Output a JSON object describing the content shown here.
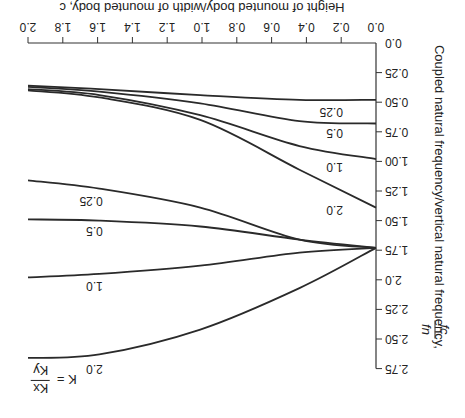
{
  "chart_data": {
    "type": "line",
    "orientation_note": "figure displayed rotated 180 degrees",
    "title": "",
    "xlabel": "Height of mounted body/width of mounted body, c",
    "ylabel": "Coupled natural frequency/vertical natural frequency, fc/fn",
    "legend_title": "K = Kx/Ky",
    "xlim": [
      0,
      2.0
    ],
    "ylim": [
      0,
      2.75
    ],
    "x_ticks": [
      "0.0",
      "0.2",
      "0.4",
      "0.6",
      "0.8",
      "1.0",
      "1.2",
      "1.4",
      "1.6",
      "1.8",
      "2.0"
    ],
    "y_ticks": [
      "0.0",
      "0.25",
      "0.50",
      "0.75",
      "1.00",
      "1.25",
      "1.50",
      "1.75",
      "2.0",
      "2.25",
      "2.50",
      "2.75"
    ],
    "grid": false,
    "x": [
      0,
      0.44,
      1.01,
      1.59,
      2.0
    ],
    "series": [
      {
        "name": "0.25 (lower mode)",
        "values": [
          0.48,
          0.48,
          0.44,
          0.39,
          0.36
        ]
      },
      {
        "name": "0.5 (lower mode)",
        "values": [
          0.68,
          0.66,
          0.51,
          0.41,
          0.37
        ]
      },
      {
        "name": "1.0 (lower mode)",
        "values": [
          0.98,
          0.87,
          0.61,
          0.44,
          0.39
        ]
      },
      {
        "name": "2.0 (lower mode)",
        "values": [
          1.39,
          1.07,
          0.65,
          0.46,
          0.4
        ]
      },
      {
        "name": "0.25 (upper mode)",
        "values": [
          1.73,
          1.66,
          1.39,
          1.23,
          1.16
        ]
      },
      {
        "name": "0.5 (upper mode)",
        "values": [
          1.73,
          1.66,
          1.55,
          1.5,
          1.49
        ]
      },
      {
        "name": "1.0 (upper mode)",
        "values": [
          1.73,
          1.77,
          1.88,
          1.95,
          1.98
        ]
      },
      {
        "name": "2.0 (upper mode)",
        "values": [
          1.73,
          2.07,
          2.42,
          2.63,
          2.66
        ]
      }
    ],
    "curve_labels": [
      {
        "text": "0.25",
        "x": 0.19,
        "y": 0.55
      },
      {
        "text": "0.5",
        "x": 0.19,
        "y": 0.73
      },
      {
        "text": "1.0",
        "x": 0.19,
        "y": 1.01
      },
      {
        "text": "2.0",
        "x": 0.19,
        "y": 1.38
      },
      {
        "text": "0.25",
        "x": 1.57,
        "y": 1.3
      },
      {
        "text": "0.5",
        "x": 1.57,
        "y": 1.55
      },
      {
        "text": "1.0",
        "x": 1.57,
        "y": 2.02
      },
      {
        "text": "2.0",
        "x": 1.57,
        "y": 2.72
      }
    ]
  },
  "labels": {
    "xlabel": "Height of mounted body/width of mounted body, c",
    "ylabel_main": "Coupled natural frequency/vertical natural frequency,",
    "ylabel_frac_num": "fc",
    "ylabel_frac_den": "fn",
    "legend_k": "K =",
    "legend_num": "Kx",
    "legend_den": "Ky"
  }
}
